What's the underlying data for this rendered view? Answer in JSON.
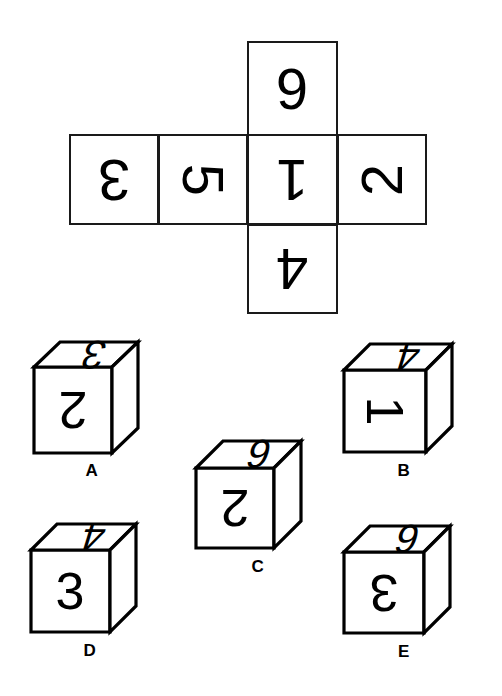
{
  "puzzle": {
    "type": "cube-net-matching",
    "background_color": "#ffffff",
    "ink_color": "#000000"
  },
  "net": {
    "name": "cube-net",
    "shape": "cross",
    "cells": [
      {
        "id": "top",
        "value": "6",
        "rotation": 180,
        "position": "top-of-center"
      },
      {
        "id": "left",
        "value": "3",
        "rotation": 180,
        "position": "row-col-1"
      },
      {
        "id": "midl",
        "value": "5",
        "rotation": 90,
        "position": "row-col-2"
      },
      {
        "id": "center",
        "value": "1",
        "rotation": 180,
        "position": "row-col-3"
      },
      {
        "id": "right",
        "value": "2",
        "rotation": 270,
        "position": "row-col-4"
      },
      {
        "id": "bottom",
        "value": "4",
        "rotation": 180,
        "position": "bottom-of-center"
      }
    ]
  },
  "cubes": [
    {
      "label": "A",
      "front": {
        "value": "2",
        "rotation": 180
      },
      "top": {
        "value": "3",
        "rotation": 180
      },
      "right": {
        "value": "4",
        "rotation": 180
      }
    },
    {
      "label": "B",
      "front": {
        "value": "1",
        "rotation": 90
      },
      "top": {
        "value": "4",
        "rotation": 180
      },
      "right": {
        "value": "5",
        "rotation": 180
      }
    },
    {
      "label": "C",
      "front": {
        "value": "2",
        "rotation": 180
      },
      "top": {
        "value": "6",
        "rotation": 180
      },
      "right": {
        "value": "3",
        "rotation": 180
      }
    },
    {
      "label": "D",
      "front": {
        "value": "3",
        "rotation": 0
      },
      "top": {
        "value": "4",
        "rotation": 180
      },
      "right": {
        "value": "2",
        "rotation": 180
      }
    },
    {
      "label": "E",
      "front": {
        "value": "3",
        "rotation": 180
      },
      "top": {
        "value": "6",
        "rotation": 180
      },
      "right": {
        "value": "5",
        "rotation": 180
      }
    }
  ]
}
